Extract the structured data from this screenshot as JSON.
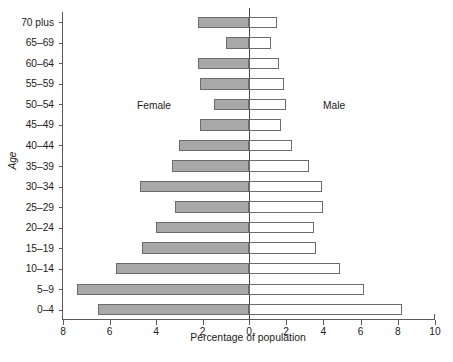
{
  "chart_data": {
    "type": "bar",
    "subtype": "population-pyramid",
    "title": "",
    "xlabel": "Percentage of population",
    "ylabel": "Age",
    "orientation": "horizontal",
    "grid": false,
    "legend_position": "inside-plot",
    "categories": [
      "70 plus",
      "65–69",
      "60–64",
      "55–59",
      "50–54",
      "45–49",
      "40–44",
      "35–39",
      "30–34",
      "25–29",
      "20–24",
      "15–19",
      "10–14",
      "5–9",
      "0–4"
    ],
    "series": [
      {
        "name": "Female",
        "side": "left",
        "fill": "#a8a8a8",
        "values": [
          2.2,
          1.0,
          2.2,
          2.1,
          1.5,
          2.1,
          3.0,
          3.3,
          4.7,
          3.2,
          4.0,
          4.6,
          5.7,
          7.4,
          6.5
        ]
      },
      {
        "name": "Male",
        "side": "right",
        "fill": "#ffffff",
        "values": [
          1.5,
          1.2,
          1.6,
          1.9,
          2.0,
          1.7,
          2.3,
          3.2,
          3.9,
          4.0,
          3.5,
          3.6,
          4.9,
          6.2,
          8.2
        ]
      }
    ],
    "x_axis": {
      "left_max": 8,
      "right_max": 10,
      "left_ticks": [
        8,
        6,
        4,
        2,
        0
      ],
      "right_ticks": [
        0,
        2,
        4,
        6,
        8,
        10
      ],
      "tick_labels": [
        "8",
        "6",
        "4",
        "2",
        "0",
        "2",
        "4",
        "6",
        "8",
        "10"
      ]
    },
    "annotations": [
      {
        "text": "Female",
        "side": "left"
      },
      {
        "text": "Male",
        "side": "right"
      }
    ]
  },
  "axes": {
    "x_title": "Percentage of population",
    "y_title": "Age",
    "x_tick_labels": [
      "8",
      "6",
      "4",
      "2",
      "0",
      "2",
      "4",
      "6",
      "8",
      "10"
    ],
    "y_tick_labels": [
      "70 plus",
      "65–69",
      "60–64",
      "55–59",
      "50–54",
      "45–49",
      "40–44",
      "35–39",
      "30–34",
      "25–29",
      "20–24",
      "15–19",
      "10–14",
      "5–9",
      "0–4"
    ]
  },
  "annotations": {
    "female_label": "Female",
    "male_label": "Male"
  },
  "colors": {
    "female_fill": "#a8a8a8",
    "male_fill": "#ffffff",
    "bar_stroke": "#6b6b6b",
    "axis": "#5a5a5a",
    "text": "#1b1b1b"
  }
}
